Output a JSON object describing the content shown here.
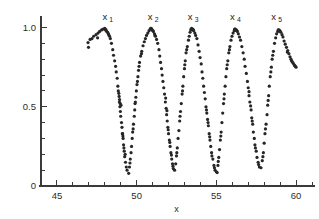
{
  "figure": {
    "background_color": "#ffffff",
    "point_color": "#262626",
    "axis_color": "#3a3a3a"
  },
  "axes": {
    "x": {
      "label": "x",
      "min": 44,
      "max": 61,
      "major_ticks": [
        45,
        50,
        55,
        60
      ],
      "major_tick_labels": [
        "45",
        "50",
        "55",
        "60"
      ],
      "minor_tick_step": 1
    },
    "y": {
      "label": "",
      "min": 0,
      "max": 1.06,
      "major_ticks": [
        0,
        0.5,
        1.0
      ],
      "major_tick_labels": [
        "0",
        "0.5",
        "1.0"
      ],
      "minor_tick_step": 0.1
    }
  },
  "annotations": [
    {
      "name": "peak-label-x1",
      "text": "x",
      "sub": "1",
      "x": 48.0,
      "y": 1.05
    },
    {
      "name": "peak-label-x2",
      "text": "x",
      "sub": "2",
      "x": 50.85,
      "y": 1.05
    },
    {
      "name": "peak-label-x3",
      "text": "x",
      "sub": "3",
      "x": 53.35,
      "y": 1.05
    },
    {
      "name": "peak-label-x4",
      "text": "x",
      "sub": "4",
      "x": 56.0,
      "y": 1.05
    },
    {
      "name": "peak-label-x5",
      "text": "x",
      "sub": "5",
      "x": 58.6,
      "y": 1.05
    }
  ],
  "chart_data": {
    "type": "scatter",
    "title": "",
    "subtitle": "",
    "xlabel": "x",
    "ylabel": "",
    "xlim": [
      44,
      61
    ],
    "ylim": [
      0,
      1.06
    ],
    "grid": false,
    "legend": null,
    "marker": "dot",
    "marker_size": 1.6,
    "series": [
      {
        "name": "oscillation-envelope",
        "points": [
          [
            46.95,
            0.905
          ],
          [
            47.08,
            0.925
          ],
          [
            47.2,
            0.93
          ],
          [
            47.3,
            0.945
          ],
          [
            47.45,
            0.955
          ],
          [
            47.58,
            0.965
          ],
          [
            47.68,
            0.975
          ],
          [
            47.8,
            0.985
          ],
          [
            47.9,
            0.99
          ],
          [
            48.0,
            0.995
          ],
          [
            48.08,
            0.985
          ],
          [
            48.12,
            0.975
          ],
          [
            48.18,
            0.97
          ],
          [
            48.25,
            0.955
          ],
          [
            48.3,
            0.945
          ],
          [
            48.35,
            0.93
          ],
          [
            46.98,
            0.875
          ],
          [
            47.55,
            0.935
          ],
          [
            48.05,
            0.985
          ],
          [
            48.22,
            0.96
          ],
          [
            48.42,
            0.9
          ],
          [
            48.5,
            0.86
          ],
          [
            48.55,
            0.825
          ],
          [
            48.62,
            0.79
          ],
          [
            48.68,
            0.755
          ],
          [
            48.72,
            0.72
          ],
          [
            48.78,
            0.68
          ],
          [
            48.82,
            0.63
          ],
          [
            48.85,
            0.6
          ],
          [
            48.9,
            0.565
          ],
          [
            48.92,
            0.53
          ],
          [
            48.95,
            0.5
          ],
          [
            48.98,
            0.47
          ],
          [
            49.0,
            0.44
          ],
          [
            49.05,
            0.4
          ],
          [
            49.08,
            0.37
          ],
          [
            49.12,
            0.33
          ],
          [
            49.15,
            0.3
          ],
          [
            49.18,
            0.26
          ],
          [
            49.22,
            0.22
          ],
          [
            49.25,
            0.185
          ],
          [
            49.3,
            0.15
          ],
          [
            49.35,
            0.12
          ],
          [
            49.4,
            0.1
          ],
          [
            48.88,
            0.585
          ],
          [
            48.93,
            0.545
          ],
          [
            48.97,
            0.52
          ],
          [
            49.02,
            0.51
          ],
          [
            49.1,
            0.33
          ],
          [
            49.14,
            0.315
          ],
          [
            49.2,
            0.24
          ],
          [
            49.28,
            0.2
          ],
          [
            49.5,
            0.08
          ],
          [
            49.55,
            0.12
          ],
          [
            49.6,
            0.17
          ],
          [
            49.65,
            0.21
          ],
          [
            49.68,
            0.25
          ],
          [
            49.72,
            0.3
          ],
          [
            49.75,
            0.34
          ],
          [
            49.8,
            0.39
          ],
          [
            49.85,
            0.44
          ],
          [
            49.88,
            0.48
          ],
          [
            49.9,
            0.52
          ],
          [
            49.95,
            0.56
          ],
          [
            49.98,
            0.6
          ],
          [
            50.02,
            0.64
          ],
          [
            50.08,
            0.69
          ],
          [
            50.12,
            0.73
          ],
          [
            50.18,
            0.78
          ],
          [
            50.25,
            0.82
          ],
          [
            50.32,
            0.85
          ],
          [
            50.4,
            0.885
          ],
          [
            49.58,
            0.145
          ],
          [
            49.78,
            0.36
          ],
          [
            49.92,
            0.53
          ],
          [
            50.05,
            0.66
          ],
          [
            50.15,
            0.755
          ],
          [
            50.3,
            0.835
          ],
          [
            50.48,
            0.91
          ],
          [
            50.55,
            0.93
          ],
          [
            50.62,
            0.95
          ],
          [
            50.7,
            0.965
          ],
          [
            50.78,
            0.98
          ],
          [
            50.85,
            0.99
          ],
          [
            50.92,
            0.995
          ],
          [
            50.98,
            0.985
          ],
          [
            51.05,
            0.975
          ],
          [
            51.12,
            0.96
          ],
          [
            51.18,
            0.945
          ],
          [
            51.25,
            0.925
          ],
          [
            50.88,
            0.995
          ],
          [
            51.02,
            0.98
          ],
          [
            51.15,
            0.95
          ],
          [
            51.32,
            0.9
          ],
          [
            51.4,
            0.86
          ],
          [
            51.45,
            0.82
          ],
          [
            51.5,
            0.78
          ],
          [
            51.56,
            0.74
          ],
          [
            51.6,
            0.7
          ],
          [
            51.65,
            0.66
          ],
          [
            51.7,
            0.62
          ],
          [
            51.75,
            0.58
          ],
          [
            51.8,
            0.53
          ],
          [
            51.85,
            0.49
          ],
          [
            51.88,
            0.45
          ],
          [
            51.92,
            0.41
          ],
          [
            51.96,
            0.37
          ],
          [
            52.0,
            0.33
          ],
          [
            52.05,
            0.29
          ],
          [
            52.1,
            0.25
          ],
          [
            52.15,
            0.21
          ],
          [
            52.2,
            0.17
          ],
          [
            52.25,
            0.14
          ],
          [
            52.3,
            0.11
          ],
          [
            51.82,
            0.555
          ],
          [
            51.9,
            0.475
          ],
          [
            51.98,
            0.355
          ],
          [
            52.08,
            0.275
          ],
          [
            52.18,
            0.195
          ],
          [
            52.28,
            0.125
          ],
          [
            52.38,
            0.1
          ],
          [
            52.45,
            0.14
          ],
          [
            52.5,
            0.19
          ],
          [
            52.55,
            0.24
          ],
          [
            52.6,
            0.3
          ],
          [
            52.65,
            0.35
          ],
          [
            52.7,
            0.41
          ],
          [
            52.75,
            0.47
          ],
          [
            52.8,
            0.52
          ],
          [
            52.85,
            0.58
          ],
          [
            52.9,
            0.63
          ],
          [
            52.95,
            0.69
          ],
          [
            53.0,
            0.74
          ],
          [
            53.05,
            0.79
          ],
          [
            53.1,
            0.84
          ],
          [
            53.18,
            0.88
          ],
          [
            52.52,
            0.21
          ],
          [
            52.72,
            0.44
          ],
          [
            52.88,
            0.6
          ],
          [
            53.02,
            0.765
          ],
          [
            53.14,
            0.86
          ],
          [
            53.25,
            0.92
          ],
          [
            53.3,
            0.945
          ],
          [
            53.35,
            0.97
          ],
          [
            53.4,
            0.985
          ],
          [
            53.45,
            0.995
          ],
          [
            53.52,
            0.99
          ],
          [
            53.58,
            0.98
          ],
          [
            53.65,
            0.965
          ],
          [
            53.7,
            0.95
          ],
          [
            53.78,
            0.93
          ],
          [
            53.42,
            0.99
          ],
          [
            53.55,
            0.985
          ],
          [
            53.85,
            0.89
          ],
          [
            53.92,
            0.85
          ],
          [
            53.98,
            0.81
          ],
          [
            54.05,
            0.77
          ],
          [
            54.1,
            0.72
          ],
          [
            54.15,
            0.68
          ],
          [
            54.2,
            0.63
          ],
          [
            54.25,
            0.59
          ],
          [
            54.3,
            0.55
          ],
          [
            54.35,
            0.5
          ],
          [
            54.4,
            0.46
          ],
          [
            54.45,
            0.42
          ],
          [
            54.5,
            0.38
          ],
          [
            54.55,
            0.33
          ],
          [
            54.6,
            0.29
          ],
          [
            54.65,
            0.25
          ],
          [
            54.7,
            0.21
          ],
          [
            54.78,
            0.17
          ],
          [
            54.85,
            0.13
          ],
          [
            54.92,
            0.1
          ],
          [
            54.38,
            0.48
          ],
          [
            54.48,
            0.4
          ],
          [
            54.58,
            0.31
          ],
          [
            54.72,
            0.19
          ],
          [
            54.88,
            0.115
          ],
          [
            55.0,
            0.09
          ],
          [
            55.05,
            0.085
          ],
          [
            55.1,
            0.13
          ],
          [
            55.15,
            0.18
          ],
          [
            55.2,
            0.23
          ],
          [
            55.25,
            0.29
          ],
          [
            55.3,
            0.34
          ],
          [
            55.35,
            0.4
          ],
          [
            55.4,
            0.46
          ],
          [
            55.45,
            0.52
          ],
          [
            55.5,
            0.58
          ],
          [
            55.55,
            0.63
          ],
          [
            55.6,
            0.69
          ],
          [
            55.65,
            0.74
          ],
          [
            55.72,
            0.79
          ],
          [
            55.78,
            0.84
          ],
          [
            55.85,
            0.88
          ],
          [
            55.12,
            0.155
          ],
          [
            55.28,
            0.315
          ],
          [
            55.48,
            0.55
          ],
          [
            55.68,
            0.765
          ],
          [
            55.82,
            0.86
          ],
          [
            55.92,
            0.92
          ],
          [
            55.98,
            0.945
          ],
          [
            56.05,
            0.965
          ],
          [
            56.12,
            0.98
          ],
          [
            56.18,
            0.99
          ],
          [
            56.25,
            0.985
          ],
          [
            56.32,
            0.975
          ],
          [
            56.38,
            0.96
          ],
          [
            56.45,
            0.94
          ],
          [
            56.52,
            0.92
          ],
          [
            56.15,
            0.99
          ],
          [
            56.28,
            0.98
          ],
          [
            56.6,
            0.88
          ],
          [
            56.68,
            0.84
          ],
          [
            56.75,
            0.8
          ],
          [
            56.8,
            0.755
          ],
          [
            56.88,
            0.71
          ],
          [
            56.95,
            0.66
          ],
          [
            57.0,
            0.62
          ],
          [
            57.05,
            0.57
          ],
          [
            57.1,
            0.53
          ],
          [
            57.18,
            0.48
          ],
          [
            57.22,
            0.43
          ],
          [
            57.28,
            0.39
          ],
          [
            57.32,
            0.34
          ],
          [
            57.38,
            0.3
          ],
          [
            57.42,
            0.26
          ],
          [
            57.5,
            0.22
          ],
          [
            57.55,
            0.18
          ],
          [
            57.62,
            0.15
          ],
          [
            57.7,
            0.12
          ],
          [
            57.05,
            0.595
          ],
          [
            57.15,
            0.505
          ],
          [
            57.25,
            0.41
          ],
          [
            57.45,
            0.24
          ],
          [
            57.65,
            0.135
          ],
          [
            57.8,
            0.115
          ],
          [
            57.88,
            0.16
          ],
          [
            57.95,
            0.21
          ],
          [
            58.0,
            0.27
          ],
          [
            58.05,
            0.33
          ],
          [
            58.12,
            0.39
          ],
          [
            58.18,
            0.45
          ],
          [
            58.22,
            0.51
          ],
          [
            58.28,
            0.57
          ],
          [
            58.32,
            0.63
          ],
          [
            58.38,
            0.69
          ],
          [
            58.45,
            0.75
          ],
          [
            58.5,
            0.8
          ],
          [
            58.58,
            0.85
          ],
          [
            57.92,
            0.185
          ],
          [
            58.08,
            0.36
          ],
          [
            58.25,
            0.54
          ],
          [
            58.42,
            0.72
          ],
          [
            58.54,
            0.825
          ],
          [
            58.65,
            0.9
          ],
          [
            58.72,
            0.935
          ],
          [
            58.78,
            0.96
          ],
          [
            58.85,
            0.975
          ],
          [
            58.92,
            0.985
          ],
          [
            58.98,
            0.98
          ],
          [
            59.05,
            0.97
          ],
          [
            59.12,
            0.955
          ],
          [
            59.18,
            0.94
          ],
          [
            58.88,
            0.985
          ],
          [
            59.0,
            0.975
          ],
          [
            59.25,
            0.915
          ],
          [
            59.32,
            0.895
          ],
          [
            59.4,
            0.875
          ],
          [
            59.48,
            0.855
          ],
          [
            59.55,
            0.835
          ],
          [
            59.62,
            0.815
          ],
          [
            59.68,
            0.8
          ],
          [
            59.75,
            0.785
          ],
          [
            59.82,
            0.775
          ],
          [
            59.88,
            0.765
          ],
          [
            59.95,
            0.755
          ],
          [
            60.0,
            0.75
          ],
          [
            59.45,
            0.845
          ],
          [
            59.72,
            0.79
          ],
          [
            59.92,
            0.76
          ]
        ]
      }
    ]
  }
}
